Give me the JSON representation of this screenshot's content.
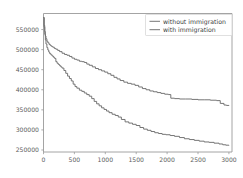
{
  "chart_data": {
    "type": "line",
    "title": "",
    "subtitle": "",
    "xlabel": "",
    "ylabel": "",
    "xlim": [
      0,
      3050
    ],
    "ylim": [
      245000,
      590000
    ],
    "grid": false,
    "legend_position": "top-right",
    "xticks": [
      0,
      500,
      1000,
      1500,
      2000,
      2500,
      3000
    ],
    "xtick_labels": [
      "0",
      "500",
      "1000",
      "1500",
      "2000",
      "2500",
      "3000"
    ],
    "yticks": [
      250000,
      300000,
      350000,
      400000,
      450000,
      500000,
      550000
    ],
    "ytick_labels": [
      "250000",
      "300000",
      "350000",
      "400000",
      "450000",
      "500000",
      "550000"
    ],
    "series": [
      {
        "name": "without immigration",
        "color": "#6e6e6e",
        "x": [
          0,
          10,
          20,
          30,
          40,
          55,
          70,
          90,
          110,
          130,
          150,
          175,
          200,
          230,
          260,
          300,
          340,
          380,
          420,
          460,
          500,
          540,
          580,
          620,
          660,
          700,
          740,
          790,
          840,
          890,
          940,
          990,
          1040,
          1090,
          1140,
          1190,
          1240,
          1300,
          1360,
          1420,
          1480,
          1540,
          1600,
          1660,
          1720,
          1780,
          1840,
          1900,
          1960,
          2020,
          2060,
          2120,
          2200,
          2300,
          2400,
          2500,
          2600,
          2700,
          2800,
          2860,
          2920,
          2960,
          3000
        ],
        "y": [
          580000,
          560000,
          545000,
          534000,
          527000,
          521000,
          517000,
          513000,
          510000,
          508000,
          506000,
          503000,
          501000,
          498000,
          495000,
          491000,
          488000,
          486000,
          483000,
          479000,
          476000,
          474000,
          471000,
          470000,
          468000,
          464000,
          461000,
          457000,
          453000,
          450000,
          447000,
          444000,
          440000,
          436000,
          431000,
          427000,
          423000,
          419000,
          416000,
          414000,
          411000,
          407000,
          403000,
          400000,
          397000,
          395000,
          393000,
          391000,
          389000,
          388000,
          379000,
          378000,
          377000,
          377000,
          376000,
          375000,
          375000,
          374000,
          373000,
          366000,
          362000,
          361000,
          360000
        ]
      },
      {
        "name": "with immigration",
        "color": "#6e6e6e",
        "x": [
          0,
          10,
          20,
          30,
          40,
          55,
          70,
          85,
          100,
          120,
          140,
          160,
          180,
          200,
          220,
          240,
          260,
          280,
          300,
          330,
          360,
          390,
          420,
          450,
          480,
          510,
          540,
          580,
          620,
          660,
          700,
          740,
          780,
          820,
          860,
          900,
          940,
          980,
          1020,
          1060,
          1110,
          1160,
          1210,
          1260,
          1320,
          1380,
          1440,
          1500,
          1560,
          1620,
          1680,
          1740,
          1800,
          1860,
          1920,
          1980,
          2050,
          2120,
          2200,
          2280,
          2360,
          2440,
          2520,
          2600,
          2680,
          2760,
          2840,
          2900,
          2950,
          3000
        ],
        "y": [
          580000,
          556000,
          538000,
          524000,
          514000,
          505000,
          499000,
          494000,
          490000,
          487000,
          484000,
          481000,
          478000,
          470000,
          466000,
          463000,
          460000,
          457000,
          454000,
          448000,
          441000,
          434000,
          428000,
          422000,
          414000,
          408000,
          404000,
          399000,
          396000,
          392000,
          388000,
          384000,
          378000,
          371000,
          365000,
          360000,
          355000,
          351000,
          347000,
          343000,
          339000,
          336000,
          332000,
          326000,
          320000,
          317000,
          314000,
          311000,
          306000,
          302000,
          299000,
          296000,
          293000,
          291000,
          289000,
          288000,
          286000,
          284000,
          281000,
          278000,
          276000,
          274000,
          272000,
          270000,
          269000,
          267000,
          265000,
          263000,
          262000,
          261000
        ]
      }
    ]
  },
  "legend": {
    "entries": [
      {
        "label": "without immigration"
      },
      {
        "label": "with immigration"
      }
    ]
  },
  "axes": {
    "x_ticks": [
      "0",
      "500",
      "1000",
      "1500",
      "2000",
      "2500",
      "3000"
    ],
    "y_ticks": [
      "250000",
      "300000",
      "350000",
      "400000",
      "450000",
      "500000",
      "550000"
    ]
  }
}
